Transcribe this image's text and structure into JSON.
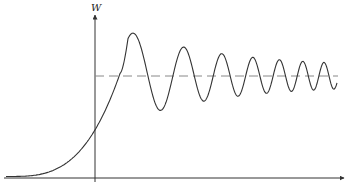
{
  "diagram": {
    "y_axis_label": "W",
    "x_axis_label": "",
    "colors": {
      "axis": "#333333",
      "curve": "#333333",
      "dashed_reference": "#888888",
      "background": "#ffffff"
    },
    "elements": [
      {
        "type": "axis",
        "orientation": "vertical",
        "label": "W"
      },
      {
        "type": "axis",
        "orientation": "horizontal",
        "label": ""
      },
      {
        "type": "dashed-line",
        "description": "steady-state asymptote"
      },
      {
        "type": "curve",
        "description": "exponential rise then overshoot with oscillations of increasing frequency and decreasing amplitude about the asymptote"
      }
    ]
  }
}
